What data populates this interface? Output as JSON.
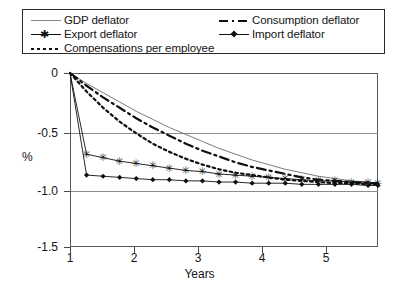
{
  "chart_data": {
    "type": "line",
    "title": "",
    "xlabel": "Years",
    "ylabel": "%",
    "xlim": [
      1,
      5.65
    ],
    "ylim": [
      -1.5,
      0
    ],
    "yticks": [
      "0",
      "-0.5",
      "-1.0",
      "-1.5"
    ],
    "ytick_values": [
      0,
      -0.5,
      -1.0,
      -1.5
    ],
    "xticks": [
      "1",
      "2",
      "3",
      "4",
      "5"
    ],
    "xtick_values": [
      1,
      2,
      3,
      4,
      5
    ],
    "grid": true,
    "legend_position": "top",
    "x": [
      1.0,
      1.25,
      1.5,
      1.75,
      2.0,
      2.25,
      2.5,
      2.75,
      3.0,
      3.25,
      3.5,
      3.75,
      4.0,
      4.25,
      4.5,
      4.75,
      5.0,
      5.25,
      5.5,
      5.65
    ],
    "series": [
      {
        "name": "GDP deflator",
        "style": "solid-thin",
        "color": "#6d6d6d",
        "marker": "none",
        "values": [
          0.0,
          -0.09,
          -0.17,
          -0.25,
          -0.33,
          -0.4,
          -0.47,
          -0.53,
          -0.59,
          -0.65,
          -0.7,
          -0.75,
          -0.79,
          -0.83,
          -0.86,
          -0.89,
          -0.91,
          -0.93,
          -0.94,
          -0.95
        ]
      },
      {
        "name": "Consumption deflator",
        "style": "dash-dot",
        "color": "#101010",
        "marker": "none",
        "values": [
          0.0,
          -0.11,
          -0.21,
          -0.3,
          -0.39,
          -0.47,
          -0.54,
          -0.61,
          -0.67,
          -0.72,
          -0.77,
          -0.81,
          -0.84,
          -0.87,
          -0.9,
          -0.92,
          -0.93,
          -0.94,
          -0.95,
          -0.95
        ]
      },
      {
        "name": "Compensations per employee",
        "style": "dotted",
        "color": "#101010",
        "marker": "none",
        "values": [
          0.0,
          -0.16,
          -0.3,
          -0.42,
          -0.52,
          -0.61,
          -0.68,
          -0.74,
          -0.79,
          -0.83,
          -0.86,
          -0.88,
          -0.9,
          -0.92,
          -0.93,
          -0.94,
          -0.95,
          -0.95,
          -0.96,
          -0.96
        ]
      },
      {
        "name": "Export deflator",
        "style": "solid-marker",
        "color": "#101010",
        "marker": "star",
        "values": [
          0.0,
          -0.7,
          -0.73,
          -0.76,
          -0.78,
          -0.8,
          -0.82,
          -0.84,
          -0.85,
          -0.87,
          -0.88,
          -0.89,
          -0.9,
          -0.91,
          -0.92,
          -0.93,
          -0.93,
          -0.94,
          -0.94,
          -0.95
        ]
      },
      {
        "name": "Import deflator",
        "style": "solid-marker",
        "color": "#101010",
        "marker": "diamond",
        "values": [
          0.0,
          -0.88,
          -0.89,
          -0.9,
          -0.91,
          -0.92,
          -0.92,
          -0.93,
          -0.93,
          -0.94,
          -0.94,
          -0.95,
          -0.95,
          -0.95,
          -0.96,
          -0.96,
          -0.96,
          -0.96,
          -0.97,
          -0.97
        ]
      }
    ]
  },
  "legend": {
    "entries": [
      {
        "label": "GDP deflator"
      },
      {
        "label": "Consumption deflator"
      },
      {
        "label": "Export deflator"
      },
      {
        "label": "Import deflator"
      },
      {
        "label": "Compensations per employee"
      }
    ]
  },
  "axes": {
    "y_title": "%",
    "x_title": "Years",
    "y_tick_labels": [
      "0",
      "-0.5",
      "-1.0",
      "-1.5"
    ],
    "x_tick_labels": [
      "1",
      "2",
      "3",
      "4",
      "5"
    ]
  }
}
